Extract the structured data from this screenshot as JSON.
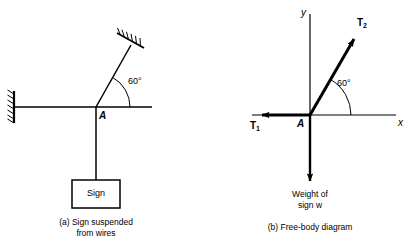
{
  "figure": {
    "background_color": "#ffffff",
    "ink_color": "#000000",
    "panels": [
      {
        "id": "a",
        "caption": "(a)  Sign suspended\nfrom wires",
        "joint_label": "A",
        "angle_label": "60°",
        "sign_box_label": "Sign",
        "support_names": [
          "wall-support-hatching",
          "ceiling-support-hatching"
        ]
      },
      {
        "id": "b",
        "caption": "(b)  Free-body diagram",
        "origin_label": "A",
        "angle_label": "60°",
        "axis_x_label": "x",
        "axis_y_label": "y",
        "vectors": [
          {
            "name": "T1",
            "symbol": "T",
            "subscript": "1",
            "direction": "left"
          },
          {
            "name": "T2",
            "symbol": "T",
            "subscript": "2",
            "direction": "up-right-60deg"
          },
          {
            "name": "weight",
            "label": "Weight of\nsign w",
            "direction": "down"
          }
        ]
      }
    ]
  }
}
